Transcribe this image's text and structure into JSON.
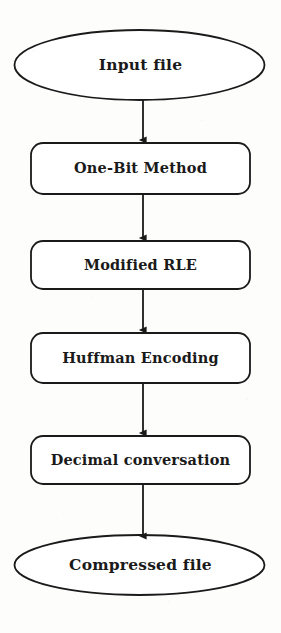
{
  "diagram": {
    "orientation": "top-to-bottom",
    "stroke_color": "#1a1a1a",
    "fill_color": "#ffffff",
    "background_color": "#fdfdfb",
    "nodes": [
      {
        "id": "input-file",
        "label": "Input file",
        "shape": "ellipse",
        "cx": 139.5,
        "cy": 65,
        "rx": 125,
        "ry": 35
      },
      {
        "id": "one-bit-method",
        "label": "One-Bit Method",
        "shape": "rounded-rectangle",
        "x": 31,
        "y": 143,
        "width": 219,
        "height": 51,
        "radius": 12
      },
      {
        "id": "modified-rle",
        "label": "Modified RLE",
        "shape": "rounded-rectangle",
        "x": 31,
        "y": 241,
        "width": 219,
        "height": 48,
        "radius": 12
      },
      {
        "id": "huffman-encoding",
        "label": "Huffman Encoding",
        "shape": "rounded-rectangle",
        "x": 31,
        "y": 333,
        "width": 219,
        "height": 50,
        "radius": 12
      },
      {
        "id": "decimal-conversation",
        "label": "Decimal conversation",
        "shape": "rounded-rectangle",
        "x": 31,
        "y": 436,
        "width": 219,
        "height": 48,
        "radius": 12
      },
      {
        "id": "compressed-file",
        "label": "Compressed file",
        "shape": "ellipse",
        "cx": 139.5,
        "cy": 565,
        "rx": 125,
        "ry": 30
      }
    ],
    "edges": [
      {
        "id": "edge-input-to-onebit",
        "from": "input-file",
        "to": "one-bit-method",
        "x": 143,
        "y1": 100,
        "y2": 143,
        "arrow": "down"
      },
      {
        "id": "edge-onebit-to-rle",
        "from": "one-bit-method",
        "to": "modified-rle",
        "x": 143,
        "y1": 194,
        "y2": 241,
        "arrow": "down"
      },
      {
        "id": "edge-rle-to-huffman",
        "from": "modified-rle",
        "to": "huffman-encoding",
        "x": 143,
        "y1": 289,
        "y2": 333,
        "arrow": "down"
      },
      {
        "id": "edge-huffman-to-decimal",
        "from": "huffman-encoding",
        "to": "decimal-conversation",
        "x": 143,
        "y1": 383,
        "y2": 436,
        "arrow": "down"
      },
      {
        "id": "edge-decimal-to-output",
        "from": "decimal-conversation",
        "to": "compressed-file",
        "x": 143,
        "y1": 484,
        "y2": 537,
        "arrow": "down"
      }
    ]
  }
}
